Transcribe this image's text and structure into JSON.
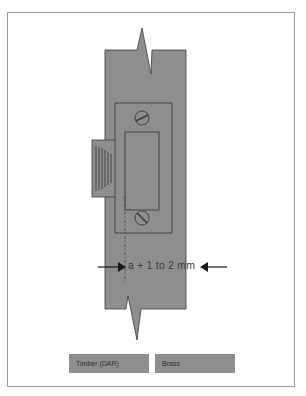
{
  "diagram": {
    "title": "",
    "dimension_label": "a + 1 to 2 mm",
    "colors": {
      "timber": "#8e8e8e",
      "brass": "#8e8e8e",
      "outline": "#3a3a3a",
      "frame": "#9a9a9a",
      "background": "#ffffff"
    },
    "components": [
      {
        "name": "timber-jamb",
        "material": "Timber (DAR)"
      },
      {
        "name": "strike-plate",
        "material": "Brass"
      },
      {
        "name": "strike-lip"
      },
      {
        "name": "strike-recess"
      },
      {
        "name": "screw-top"
      },
      {
        "name": "screw-bottom"
      },
      {
        "name": "centre-line"
      },
      {
        "name": "dimension-arrow-left"
      },
      {
        "name": "dimension-arrow-right"
      }
    ]
  },
  "legend": {
    "items": [
      {
        "label": "Timber (DAR)"
      },
      {
        "label": "Brass"
      }
    ]
  }
}
